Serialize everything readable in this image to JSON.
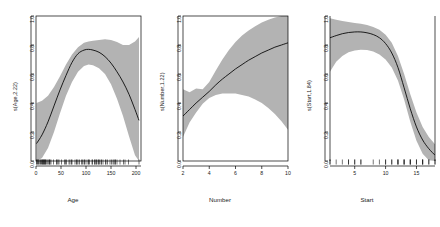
{
  "figure": {
    "background": "#ffffff",
    "band_color": "#b3b3b3",
    "line_color": "#000000",
    "axis_color": "#000000",
    "panel_count": 3
  },
  "chart_data": [
    {
      "type": "line",
      "title": "",
      "xlabel": "Age",
      "ylabel": "s(Age,2.22)",
      "xlim": [
        0,
        210
      ],
      "ylim": [
        0.0,
        1.0
      ],
      "grid": false,
      "legend": "none",
      "xticks": [
        "0",
        "50",
        "100",
        "150",
        "200"
      ],
      "xtick_values": [
        0,
        50,
        100,
        150,
        200
      ],
      "yticks": [
        "0.0",
        "0.2",
        "0.4",
        "0.6",
        "0.8",
        "1.0"
      ],
      "ytick_values": [
        0.0,
        0.2,
        0.4,
        0.6,
        0.8,
        1.0
      ],
      "annotations": [
        "rug marks on x-axis showing observed Age values"
      ],
      "series": [
        {
          "name": "s(Age,2.22)",
          "x": [
            1,
            12,
            24,
            36,
            48,
            60,
            72,
            84,
            96,
            105,
            114,
            126,
            138,
            150,
            162,
            174,
            186,
            198,
            206
          ],
          "values": [
            0.12,
            0.18,
            0.27,
            0.38,
            0.49,
            0.59,
            0.68,
            0.74,
            0.765,
            0.77,
            0.765,
            0.75,
            0.72,
            0.675,
            0.615,
            0.545,
            0.46,
            0.355,
            0.28
          ]
        },
        {
          "name": "upper 95% band",
          "x": [
            1,
            12,
            24,
            36,
            48,
            60,
            72,
            84,
            96,
            105,
            114,
            126,
            138,
            150,
            162,
            174,
            186,
            198,
            206
          ],
          "values": [
            0.4,
            0.415,
            0.45,
            0.51,
            0.585,
            0.665,
            0.735,
            0.785,
            0.815,
            0.825,
            0.83,
            0.835,
            0.84,
            0.835,
            0.82,
            0.8,
            0.8,
            0.825,
            0.855
          ]
        },
        {
          "name": "lower 95% band",
          "x": [
            1,
            12,
            24,
            36,
            48,
            60,
            72,
            84,
            96,
            105,
            114,
            126,
            138,
            150,
            162,
            174,
            186,
            198,
            206
          ],
          "values": [
            -0.02,
            0.02,
            0.09,
            0.2,
            0.33,
            0.45,
            0.545,
            0.615,
            0.655,
            0.665,
            0.66,
            0.64,
            0.6,
            0.53,
            0.43,
            0.31,
            0.17,
            0.04,
            -0.02
          ]
        }
      ]
    },
    {
      "type": "line",
      "title": "",
      "xlabel": "Number",
      "ylabel": "s(Number,1.22)",
      "xlim": [
        2,
        10
      ],
      "ylim": [
        0.0,
        1.0
      ],
      "grid": false,
      "legend": "none",
      "xticks": [
        "2",
        "4",
        "6",
        "8",
        "10"
      ],
      "xtick_values": [
        2,
        4,
        6,
        8,
        10
      ],
      "yticks": [
        "0.0",
        "0.2",
        "0.4",
        "0.6",
        "0.8",
        "1.0"
      ],
      "ytick_values": [
        0.0,
        0.2,
        0.4,
        0.6,
        0.8,
        1.0
      ],
      "annotations": [
        "confidence band narrows near Number = 3.6"
      ],
      "series": [
        {
          "name": "s(Number,1.22)",
          "x": [
            2.0,
            2.5,
            3.0,
            3.5,
            4.0,
            4.5,
            5.0,
            5.5,
            6.0,
            6.5,
            7.0,
            7.5,
            8.0,
            8.5,
            9.0,
            9.5,
            10.0
          ],
          "values": [
            0.31,
            0.355,
            0.4,
            0.44,
            0.48,
            0.525,
            0.565,
            0.6,
            0.635,
            0.665,
            0.695,
            0.72,
            0.745,
            0.765,
            0.785,
            0.8,
            0.815
          ]
        },
        {
          "name": "upper 95% band",
          "x": [
            2.0,
            2.5,
            3.0,
            3.5,
            4.0,
            4.5,
            5.0,
            5.5,
            6.0,
            6.5,
            7.0,
            7.5,
            8.0,
            8.5,
            9.0,
            9.5,
            10.0
          ],
          "values": [
            0.495,
            0.475,
            0.5,
            0.495,
            0.545,
            0.625,
            0.7,
            0.765,
            0.82,
            0.865,
            0.9,
            0.93,
            0.955,
            0.975,
            0.99,
            1.0,
            1.0
          ]
        },
        {
          "name": "lower 95% band",
          "x": [
            2.0,
            2.5,
            3.0,
            3.5,
            4.0,
            4.5,
            5.0,
            5.5,
            6.0,
            6.5,
            7.0,
            7.5,
            8.0,
            8.5,
            9.0,
            9.5,
            10.0
          ],
          "values": [
            0.165,
            0.265,
            0.335,
            0.395,
            0.435,
            0.455,
            0.465,
            0.465,
            0.465,
            0.455,
            0.445,
            0.425,
            0.4,
            0.365,
            0.325,
            0.275,
            0.215
          ]
        }
      ]
    },
    {
      "type": "line",
      "title": "",
      "xlabel": "Start",
      "ylabel": "s(Start,1.84)",
      "xlim": [
        1,
        18
      ],
      "ylim": [
        0.0,
        1.0
      ],
      "grid": false,
      "legend": "none",
      "xticks": [
        "5",
        "10",
        "15"
      ],
      "xtick_values": [
        5,
        10,
        15
      ],
      "yticks": [
        "0.0",
        "0.2",
        "0.4",
        "0.6",
        "0.8",
        "1.0"
      ],
      "ytick_values": [
        0.0,
        0.2,
        0.4,
        0.6,
        0.8,
        1.0
      ],
      "annotations": [
        "rug marks on x-axis showing observed Start values"
      ],
      "series": [
        {
          "name": "s(Start,1.84)",
          "x": [
            1,
            2,
            3,
            4,
            5,
            6,
            7,
            8,
            9,
            10,
            11,
            12,
            13,
            14,
            15,
            16,
            17,
            18
          ],
          "values": [
            0.85,
            0.865,
            0.878,
            0.886,
            0.89,
            0.89,
            0.884,
            0.872,
            0.85,
            0.81,
            0.745,
            0.645,
            0.505,
            0.36,
            0.235,
            0.145,
            0.085,
            0.04
          ]
        },
        {
          "name": "upper 95% band",
          "x": [
            1,
            2,
            3,
            4,
            5,
            6,
            7,
            8,
            9,
            10,
            11,
            12,
            13,
            14,
            15,
            16,
            17,
            18
          ],
          "values": [
            0.985,
            0.975,
            0.965,
            0.958,
            0.952,
            0.946,
            0.938,
            0.925,
            0.905,
            0.87,
            0.815,
            0.725,
            0.6,
            0.46,
            0.335,
            0.235,
            0.165,
            0.115
          ]
        },
        {
          "name": "lower 95% band",
          "x": [
            1,
            2,
            3,
            4,
            5,
            6,
            7,
            8,
            9,
            10,
            11,
            12,
            13,
            14,
            15,
            16,
            17,
            18
          ],
          "values": [
            0.615,
            0.685,
            0.725,
            0.75,
            0.762,
            0.768,
            0.765,
            0.755,
            0.735,
            0.7,
            0.645,
            0.555,
            0.425,
            0.27,
            0.14,
            0.05,
            0.005,
            -0.025
          ]
        }
      ]
    }
  ],
  "panels": [
    {
      "id": "age",
      "ylabel": "s(Age,2.22)",
      "xlabel": "Age",
      "yticks": [
        "0.0",
        "0.2",
        "0.4",
        "0.6",
        "0.8",
        "1.0"
      ],
      "xticks": [
        "0",
        "50",
        "100",
        "150",
        "200"
      ]
    },
    {
      "id": "number",
      "ylabel": "s(Number,1.22)",
      "xlabel": "Number",
      "yticks": [
        "0.0",
        "0.2",
        "0.4",
        "0.6",
        "0.8",
        "1.0"
      ],
      "xticks": [
        "2",
        "4",
        "6",
        "8",
        "10"
      ]
    },
    {
      "id": "start",
      "ylabel": "s(Start,1.84)",
      "xlabel": "Start",
      "yticks": [
        "0.0",
        "0.2",
        "0.4",
        "0.6",
        "0.8",
        "1.0"
      ],
      "xticks": [
        "5",
        "10",
        "15"
      ]
    }
  ]
}
